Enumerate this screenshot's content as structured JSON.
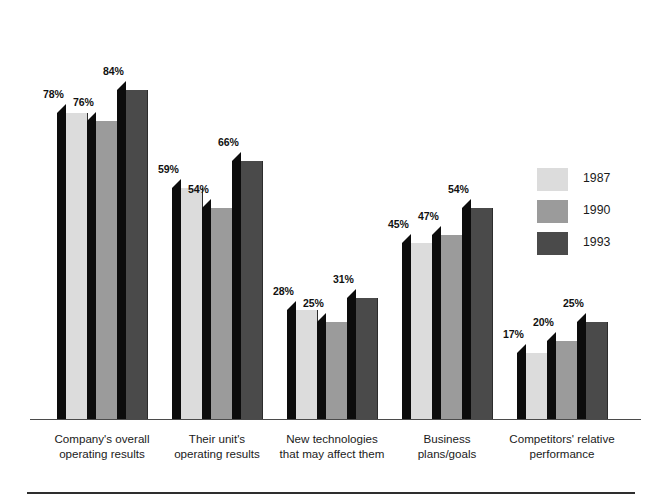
{
  "chart_data": {
    "type": "bar",
    "title": "",
    "subtitle": "",
    "xlabel": "",
    "ylabel": "",
    "ylim": [
      0,
      100
    ],
    "grid": false,
    "legend_position": "right",
    "value_suffix": "%",
    "categories": [
      "Company's overall\noperating results",
      "Their unit's\noperating results",
      "New technologies\nthat may affect them",
      "Business\nplans/goals",
      "Competitors' relative\nperformance"
    ],
    "series": [
      {
        "name": "1987",
        "color": "#dcdcdc",
        "values": [
          78,
          59,
          28,
          45,
          17
        ],
        "labels": [
          "78%",
          "59%",
          "28%",
          "45%",
          "17%"
        ]
      },
      {
        "name": "1990",
        "color": "#9b9b9b",
        "values": [
          76,
          54,
          25,
          47,
          20
        ],
        "labels": [
          "76%",
          "54%",
          "25%",
          "47%",
          "20%"
        ]
      },
      {
        "name": "1993",
        "color": "#4a4a4a",
        "values": [
          84,
          66,
          31,
          54,
          25
        ],
        "labels": [
          "84%",
          "66%",
          "31%",
          "54%",
          "25%"
        ]
      }
    ]
  },
  "legend": {
    "entries": [
      {
        "label": "1987",
        "color": "#dcdcdc"
      },
      {
        "label": "1990",
        "color": "#9b9b9b"
      },
      {
        "label": "1993",
        "color": "#4a4a4a"
      }
    ]
  },
  "axis": {
    "baseline_color": "#4b4b4b"
  },
  "footer": {
    "rule_color": "#2e2e2e"
  }
}
